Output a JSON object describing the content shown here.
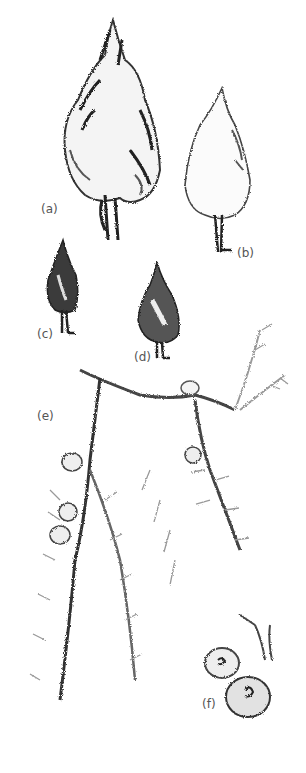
{
  "figure": {
    "labels": {
      "a": "(a)",
      "b": "(b)",
      "c": "(c)",
      "d": "(d)",
      "e": "(e)",
      "f": "(f)"
    },
    "colors": {
      "ink": "#2a2a2a",
      "mid": "#777777",
      "light": "#bbbbbb",
      "background": "#ffffff"
    }
  }
}
